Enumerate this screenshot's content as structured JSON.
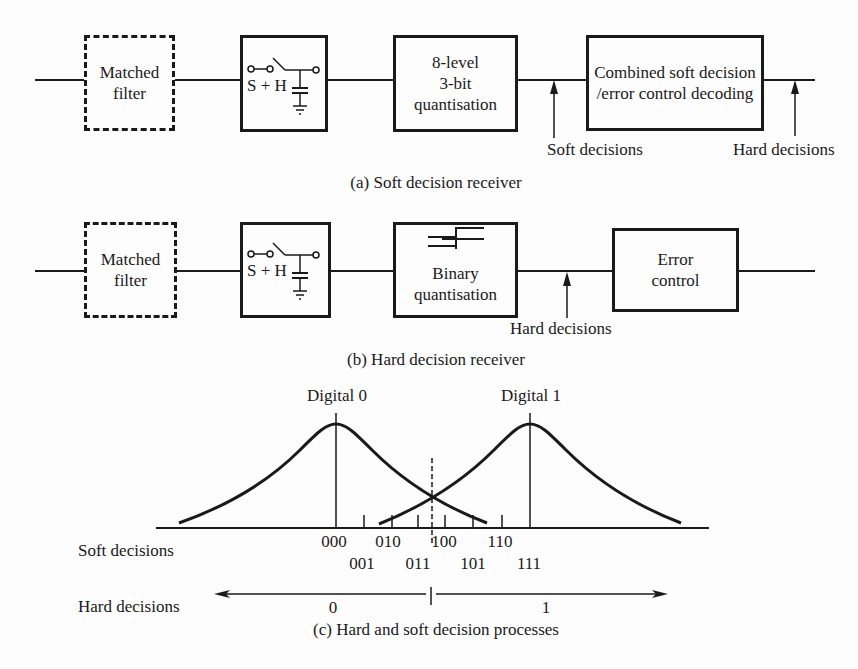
{
  "panel_a": {
    "caption": "(a) Soft decision receiver",
    "blocks": [
      {
        "id": "matched-filter",
        "lines": [
          "Matched",
          "filter"
        ],
        "style": "dashed"
      },
      {
        "id": "sample-hold",
        "label": "S + H",
        "style": "solid"
      },
      {
        "id": "quantiser",
        "lines": [
          "8-level",
          "3-bit",
          "quantisation"
        ],
        "style": "solid"
      },
      {
        "id": "decoder",
        "lines": [
          "Combined soft decision",
          "/error control decoding"
        ],
        "style": "solid"
      }
    ],
    "annotations": [
      {
        "label": "Soft decisions"
      },
      {
        "label": "Hard decisions"
      }
    ]
  },
  "panel_b": {
    "caption": "(b) Hard decision receiver",
    "blocks": [
      {
        "id": "matched-filter",
        "lines": [
          "Matched",
          "filter"
        ],
        "style": "dashed"
      },
      {
        "id": "sample-hold",
        "label": "S + H",
        "style": "solid"
      },
      {
        "id": "quantiser",
        "lines": [
          "Binary",
          "quantisation"
        ],
        "style": "solid"
      },
      {
        "id": "error-control",
        "lines": [
          "Error",
          "control"
        ],
        "style": "solid"
      }
    ],
    "annotations": [
      {
        "label": "Hard decisions"
      }
    ]
  },
  "panel_c": {
    "caption": "(c) Hard and soft decision processes",
    "peak_labels": [
      "Digital 0",
      "Digital 1"
    ],
    "row_labels": {
      "soft": "Soft decisions",
      "hard": "Hard decisions"
    },
    "soft_levels_upper": [
      "000",
      "010",
      "100",
      "110"
    ],
    "soft_levels_lower": [
      "001",
      "011",
      "101",
      "111"
    ],
    "hard_levels": [
      "0",
      "1"
    ]
  },
  "colors": {
    "ink": "#1a1a1a",
    "paper": "#fdfdfd"
  }
}
